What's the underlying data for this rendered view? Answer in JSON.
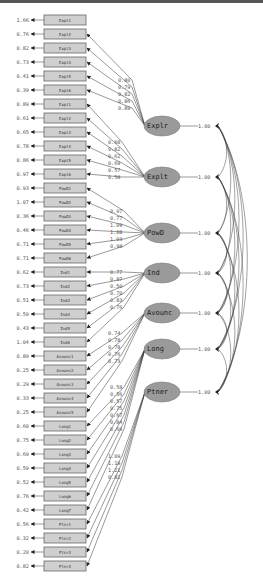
{
  "diagram": {
    "type": "CFA path diagram (standardized solution)",
    "top_bar_color": "#555555",
    "colors": {
      "indicator_fill": "#cfcfcf",
      "factor_fill": "#9a9a9a",
      "line": "#333333",
      "text": "#555555"
    },
    "indicators": [
      {
        "name": "Expl1",
        "residual": "1.66",
        "factor": 0,
        "y": 20
      },
      {
        "name": "Expl2",
        "residual": "0.76",
        "factor": 0,
        "y": 34
      },
      {
        "name": "Expl3",
        "residual": "0.82",
        "factor": 0,
        "y": 48
      },
      {
        "name": "Expl4",
        "residual": "0.73",
        "factor": 0,
        "y": 62
      },
      {
        "name": "Expl5",
        "residual": "0.41",
        "factor": 0,
        "y": 76
      },
      {
        "name": "Expl6",
        "residual": "0.39",
        "factor": 0,
        "y": 90
      },
      {
        "name": "Expl1",
        "residual": "0.89",
        "factor": 1,
        "y": 104
      },
      {
        "name": "Expl2",
        "residual": "0.61",
        "factor": 1,
        "y": 118
      },
      {
        "name": "Expl3",
        "residual": "0.65",
        "factor": 1,
        "y": 132
      },
      {
        "name": "Expl4",
        "residual": "0.78",
        "factor": 1,
        "y": 146
      },
      {
        "name": "Expl5",
        "residual": "0.86",
        "factor": 1,
        "y": 160
      },
      {
        "name": "Expl6",
        "residual": "0.97",
        "factor": 1,
        "y": 174
      },
      {
        "name": "PowD1",
        "residual": "0.93",
        "factor": 2,
        "y": 188
      },
      {
        "name": "PowD2",
        "residual": "1.07",
        "factor": 2,
        "y": 202
      },
      {
        "name": "PowD3",
        "residual": "0.36",
        "factor": 2,
        "y": 216
      },
      {
        "name": "PowD4",
        "residual": "0.46",
        "factor": 2,
        "y": 230
      },
      {
        "name": "PowD5",
        "residual": "0.71",
        "factor": 2,
        "y": 244
      },
      {
        "name": "PowD6",
        "residual": "0.71",
        "factor": 2,
        "y": 258
      },
      {
        "name": "Ind1",
        "residual": "0.62",
        "factor": 3,
        "y": 272
      },
      {
        "name": "Ind2",
        "residual": "0.73",
        "factor": 3,
        "y": 286
      },
      {
        "name": "Ind3",
        "residual": "0.51",
        "factor": 3,
        "y": 300
      },
      {
        "name": "Ind4",
        "residual": "0.59",
        "factor": 3,
        "y": 314
      },
      {
        "name": "Ind5",
        "residual": "0.43",
        "factor": 3,
        "y": 328
      },
      {
        "name": "Ind6",
        "residual": "1.04",
        "factor": 3,
        "y": 342
      },
      {
        "name": "Avounc1",
        "residual": "0.89",
        "factor": 4,
        "y": 356
      },
      {
        "name": "Avounc2",
        "residual": "0.25",
        "factor": 4,
        "y": 370
      },
      {
        "name": "Avounc3",
        "residual": "0.29",
        "factor": 4,
        "y": 384
      },
      {
        "name": "Avounc4",
        "residual": "0.33",
        "factor": 4,
        "y": 398
      },
      {
        "name": "Avounc5",
        "residual": "0.25",
        "factor": 4,
        "y": 412
      },
      {
        "name": "Long1",
        "residual": "0.60",
        "factor": 5,
        "y": 426
      },
      {
        "name": "Long2",
        "residual": "0.75",
        "factor": 5,
        "y": 440
      },
      {
        "name": "Long3",
        "residual": "0.69",
        "factor": 5,
        "y": 454
      },
      {
        "name": "Long4",
        "residual": "0.59",
        "factor": 5,
        "y": 468
      },
      {
        "name": "Long5",
        "residual": "0.52",
        "factor": 5,
        "y": 482
      },
      {
        "name": "Long6",
        "residual": "0.76",
        "factor": 5,
        "y": 496
      },
      {
        "name": "Long7",
        "residual": "0.42",
        "factor": 5,
        "y": 510
      },
      {
        "name": "Ptnr1",
        "residual": "0.56",
        "factor": 6,
        "y": 524
      },
      {
        "name": "Ptnr2",
        "residual": "0.32",
        "factor": 6,
        "y": 538
      },
      {
        "name": "Ptnr3",
        "residual": "0.20",
        "factor": 6,
        "y": 552
      },
      {
        "name": "Ptnr4",
        "residual": "0.82",
        "factor": 6,
        "y": 566
      }
    ],
    "factors": [
      {
        "name": "Explr",
        "variance": "1.00",
        "cx": 162,
        "cy": 126,
        "loadings": [
          "0.80",
          "0.79",
          "0.82",
          "0.86",
          "0.89"
        ],
        "load_y": [
          80,
          87,
          94,
          101,
          108
        ],
        "load_x": 118,
        "from": [
          1,
          2,
          3,
          4,
          5
        ]
      },
      {
        "name": "Explt",
        "variance": "1.00",
        "cx": 162,
        "cy": 177,
        "loadings": [
          "0.68",
          "0.82",
          "0.62",
          "0.69",
          "0.57",
          "0.58"
        ],
        "load_y": [
          142,
          149,
          156,
          163,
          170,
          177
        ],
        "load_x": 108,
        "from": [
          6,
          7,
          8,
          9,
          10,
          11
        ]
      },
      {
        "name": "PowD",
        "variance": "1.00",
        "cx": 162,
        "cy": 233,
        "loadings": [
          "0.97",
          "0.77",
          "1.09",
          "1.08",
          "1.03",
          "0.98"
        ],
        "load_y": [
          211,
          218,
          225,
          232,
          239,
          246
        ],
        "load_x": 110,
        "from": [
          12,
          13,
          14,
          15,
          16,
          17
        ]
      },
      {
        "name": "Ind",
        "variance": "1.00",
        "cx": 162,
        "cy": 273,
        "loadings": [
          "0.77",
          "0.87",
          "0.50",
          "0.70",
          "0.83",
          "0.76"
        ],
        "load_y": [
          272,
          279,
          286,
          293,
          300,
          307
        ],
        "load_x": 110,
        "from": [
          18,
          19,
          20,
          21,
          22,
          23
        ]
      },
      {
        "name": "Avounc",
        "variance": "1.00",
        "cx": 162,
        "cy": 313,
        "loadings": [
          "0.74",
          "0.78",
          "0.78",
          "0.76",
          "0.73"
        ],
        "load_y": [
          333,
          340,
          347,
          354,
          361
        ],
        "load_x": 108,
        "from": [
          24,
          25,
          26,
          27,
          28
        ]
      },
      {
        "name": "Long",
        "variance": "1.00",
        "cx": 162,
        "cy": 349,
        "loadings": [
          "0.58",
          "0.56",
          "0.57",
          "0.75",
          "0.67",
          "0.84",
          "0.69"
        ],
        "load_y": [
          387,
          394,
          401,
          408,
          415,
          422,
          429
        ],
        "load_x": 110,
        "from": [
          29,
          30,
          31,
          32,
          33,
          34,
          35
        ]
      },
      {
        "name": "Ptner",
        "variance": "1.00",
        "cx": 162,
        "cy": 392,
        "loadings": [
          "1.09",
          "1.19",
          "1.21",
          "0.82"
        ],
        "load_y": [
          456,
          463,
          470,
          477
        ],
        "load_x": 108,
        "from": [
          36,
          37,
          38,
          39
        ]
      }
    ],
    "variance_arrow_x": 213,
    "covariance_anchor_x": 218
  }
}
